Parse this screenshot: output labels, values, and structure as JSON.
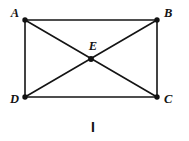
{
  "figure": {
    "caption": "I",
    "background_color": "#ffffff",
    "line_color": "#141414",
    "dot_color": "#121212",
    "label_color": "#121212",
    "line_width": 1.6,
    "dot_radius": 2.6,
    "shape": "rectangle-with-diagonals",
    "vertices": [
      {
        "id": "A",
        "label": "A",
        "x": 25,
        "y": 20,
        "label_x": 11,
        "label_y": 16
      },
      {
        "id": "B",
        "label": "B",
        "x": 157,
        "y": 20,
        "label_x": 166,
        "label_y": 16
      },
      {
        "id": "C",
        "label": "C",
        "x": 157,
        "y": 97,
        "label_x": 166,
        "label_y": 103
      },
      {
        "id": "D",
        "label": "D",
        "x": 25,
        "y": 97,
        "label_x": 9,
        "label_y": 103
      },
      {
        "id": "E",
        "label": "E",
        "x": 91,
        "y": 59,
        "label_x": 88,
        "label_y": 48
      }
    ],
    "edges": [
      {
        "id": "AB",
        "from": "A",
        "to": "B",
        "x1": 25,
        "y1": 20,
        "x2": 157,
        "y2": 20
      },
      {
        "id": "BC",
        "from": "B",
        "to": "C",
        "x1": 157,
        "y1": 20,
        "x2": 157,
        "y2": 97
      },
      {
        "id": "DC",
        "from": "D",
        "to": "C",
        "x1": 25,
        "y1": 97,
        "x2": 157,
        "y2": 97
      },
      {
        "id": "AD",
        "from": "A",
        "to": "D",
        "x1": 25,
        "y1": 20,
        "x2": 25,
        "y2": 97
      }
    ],
    "diagonals": [
      {
        "id": "AC",
        "from": "A",
        "to": "C",
        "x1": 25,
        "y1": 20,
        "x2": 157,
        "y2": 97
      },
      {
        "id": "BD",
        "from": "B",
        "to": "D",
        "x1": 157,
        "y1": 20,
        "x2": 25,
        "y2": 97
      }
    ],
    "caption_position": {
      "x": 93,
      "y": 131
    }
  }
}
